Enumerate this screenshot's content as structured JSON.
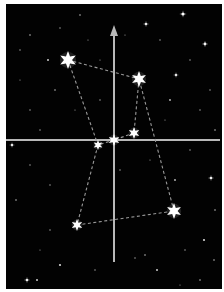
{
  "diagram": {
    "colors": {
      "background": "#020202",
      "axis": "#b8b8b8",
      "connector": "#9a9a9a",
      "star": "#ffffff",
      "frame_bg": "#ffffff"
    },
    "axes": {
      "vertical": {
        "x": 114,
        "y_top": 25,
        "y_bottom": 262,
        "arrow": "up"
      },
      "horizontal": {
        "y": 140,
        "x_left": 6,
        "x_right": 220
      }
    },
    "major_stars": [
      {
        "id": "A",
        "x": 68,
        "y": 60,
        "size": 9
      },
      {
        "id": "B",
        "x": 139,
        "y": 79,
        "size": 8
      },
      {
        "id": "C",
        "x": 134,
        "y": 133,
        "size": 6
      },
      {
        "id": "D",
        "x": 114,
        "y": 140,
        "size": 6
      },
      {
        "id": "E",
        "x": 98,
        "y": 145,
        "size": 5
      },
      {
        "id": "F",
        "x": 77,
        "y": 225,
        "size": 6
      },
      {
        "id": "G",
        "x": 174,
        "y": 211,
        "size": 8
      }
    ],
    "connections": [
      [
        "A",
        "B"
      ],
      [
        "B",
        "C"
      ],
      [
        "C",
        "D"
      ],
      [
        "D",
        "E"
      ],
      [
        "A",
        "E"
      ],
      [
        "E",
        "F"
      ],
      [
        "F",
        "G"
      ],
      [
        "G",
        "B"
      ]
    ],
    "background_stars": [
      [
        183,
        14,
        1.6
      ],
      [
        146,
        24,
        1.3
      ],
      [
        205,
        44,
        1.4
      ],
      [
        176,
        75,
        1.2
      ],
      [
        48,
        60,
        1.0
      ],
      [
        30,
        35,
        0.8
      ],
      [
        60,
        28,
        0.7
      ],
      [
        80,
        15,
        0.8
      ],
      [
        20,
        50,
        0.7
      ],
      [
        55,
        90,
        0.8
      ],
      [
        30,
        110,
        0.7
      ],
      [
        170,
        100,
        0.9
      ],
      [
        200,
        110,
        0.7
      ],
      [
        190,
        60,
        0.7
      ],
      [
        160,
        40,
        0.7
      ],
      [
        100,
        60,
        0.6
      ],
      [
        40,
        130,
        0.7
      ],
      [
        12,
        145,
        1.2
      ],
      [
        30,
        165,
        0.7
      ],
      [
        16,
        200,
        0.8
      ],
      [
        50,
        185,
        0.7
      ],
      [
        60,
        265,
        1.1
      ],
      [
        27,
        280,
        1.3
      ],
      [
        37,
        280,
        1.0
      ],
      [
        175,
        180,
        0.9
      ],
      [
        211,
        178,
        1.3
      ],
      [
        204,
        240,
        1.1
      ],
      [
        214,
        260,
        0.8
      ],
      [
        190,
        150,
        0.7
      ],
      [
        145,
        255,
        0.8
      ],
      [
        157,
        270,
        1.0
      ],
      [
        135,
        258,
        0.7
      ],
      [
        95,
        270,
        0.7
      ],
      [
        120,
        170,
        0.7
      ],
      [
        150,
        160,
        0.6
      ],
      [
        50,
        230,
        0.7
      ],
      [
        40,
        250,
        0.6
      ],
      [
        200,
        280,
        0.8
      ],
      [
        180,
        285,
        0.6
      ],
      [
        100,
        100,
        0.7
      ],
      [
        88,
        40,
        0.6
      ],
      [
        125,
        35,
        0.6
      ],
      [
        210,
        90,
        0.7
      ],
      [
        215,
        210,
        0.8
      ],
      [
        165,
        120,
        0.6
      ],
      [
        75,
        110,
        0.6
      ],
      [
        20,
        80,
        0.6
      ],
      [
        215,
        130,
        0.8
      ],
      [
        185,
        250,
        0.7
      ]
    ]
  }
}
